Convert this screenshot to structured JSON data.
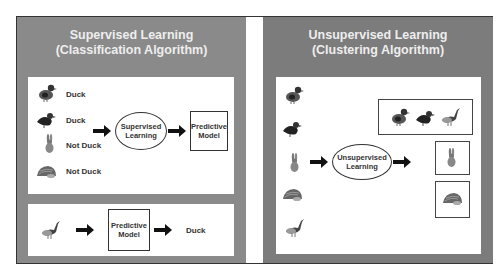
{
  "supervised": {
    "title_line1": "Supervised Learning",
    "title_line2": "(Classification Algorithm)",
    "training": [
      {
        "animal": "duck-icon",
        "label": "Duck"
      },
      {
        "animal": "duck-dark-icon",
        "label": "Duck"
      },
      {
        "animal": "rabbit-icon",
        "label": "Not Duck"
      },
      {
        "animal": "hedgehog-icon",
        "label": "Not Duck"
      }
    ],
    "process_label": "Supervised Learning",
    "model_label": "Predictive Model",
    "test": {
      "input": "goose-icon",
      "model_label": "Predictive Model",
      "output_label": "Duck"
    }
  },
  "unsupervised": {
    "title_line1": "Unsupervised Learning",
    "title_line2": "(Clustering Algorithm)",
    "inputs": [
      "duck-icon",
      "duck-dark-icon",
      "rabbit-icon",
      "hedgehog-icon",
      "goose-icon"
    ],
    "process_label": "Unsupervised Learning",
    "clusters": [
      [
        "duck-icon",
        "duck-dark-icon",
        "goose-icon"
      ],
      [
        "rabbit-icon"
      ],
      [
        "hedgehog-icon"
      ]
    ]
  },
  "colors": {
    "panel_left": "#8a8a8a",
    "panel_right": "#7c7c7c",
    "title_text": "#eeeeee",
    "line": "#333333"
  }
}
